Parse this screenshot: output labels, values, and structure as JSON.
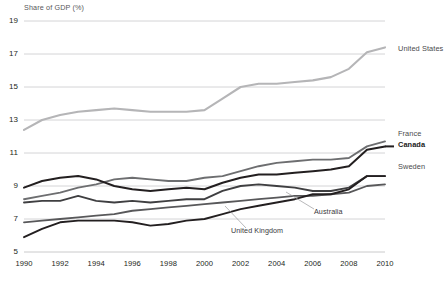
{
  "chart_data": {
    "type": "line",
    "title": "Share of GDP (%)",
    "xlabel": "",
    "ylabel": "Share of GDP (%)",
    "xlim": [
      1990,
      2010
    ],
    "ylim": [
      5,
      19
    ],
    "grid": true,
    "legend_position": "right",
    "y_ticks": [
      "19",
      "17",
      "15",
      "13",
      "11",
      "9",
      "7",
      "5"
    ],
    "y_tick_values": [
      19,
      17,
      15,
      13,
      11,
      9,
      7,
      5
    ],
    "x_ticks": [
      "1990",
      "1992",
      "1994",
      "1996",
      "1998",
      "2000",
      "2002",
      "2004",
      "2006",
      "2008",
      "2010"
    ],
    "x_tick_values": [
      1990,
      1992,
      1994,
      1996,
      1998,
      2000,
      2002,
      2004,
      2006,
      2008,
      2010
    ],
    "x": [
      1990,
      1991,
      1992,
      1993,
      1994,
      1995,
      1996,
      1997,
      1998,
      1999,
      2000,
      2001,
      2002,
      2003,
      2004,
      2005,
      2006,
      2007,
      2008,
      2009,
      2010
    ],
    "series": [
      {
        "name": "United States",
        "label_style": "right-legend",
        "color": "#b5b5b7",
        "width": 2.1,
        "values": [
          12.4,
          13.0,
          13.3,
          13.5,
          13.6,
          13.7,
          13.6,
          13.5,
          13.5,
          13.5,
          13.6,
          14.3,
          15.0,
          15.2,
          15.2,
          15.3,
          15.4,
          15.6,
          16.1,
          17.1,
          17.4
        ]
      },
      {
        "name": "France",
        "label_style": "right-legend",
        "color": "#6d6e70",
        "width": 1.9,
        "values": [
          8.2,
          8.4,
          8.6,
          8.9,
          9.1,
          9.4,
          9.5,
          9.4,
          9.3,
          9.3,
          9.5,
          9.6,
          9.9,
          10.2,
          10.4,
          10.5,
          10.6,
          10.6,
          10.7,
          11.4,
          11.7
        ]
      },
      {
        "name": "Canada",
        "label_style": "right-legend-bold",
        "color": "#231f20",
        "width": 2.0,
        "values": [
          8.9,
          9.3,
          9.5,
          9.6,
          9.4,
          9.0,
          8.8,
          8.7,
          8.8,
          8.9,
          8.8,
          9.2,
          9.5,
          9.7,
          9.7,
          9.8,
          9.9,
          10.0,
          10.2,
          11.2,
          11.4
        ]
      },
      {
        "name": "Sweden",
        "label_style": "right-legend",
        "color": "#3f3f41",
        "width": 1.9,
        "values": [
          8.0,
          8.1,
          8.1,
          8.4,
          8.1,
          8.0,
          8.1,
          8.0,
          8.1,
          8.2,
          8.2,
          8.7,
          9.0,
          9.1,
          9.0,
          8.9,
          8.7,
          8.7,
          8.9,
          9.6,
          9.6
        ]
      },
      {
        "name": "Australia",
        "label_style": "inline-annotation",
        "color": "#58585a",
        "width": 1.8,
        "values": [
          6.8,
          6.9,
          7.0,
          7.1,
          7.2,
          7.3,
          7.5,
          7.6,
          7.7,
          7.8,
          7.9,
          8.0,
          8.1,
          8.2,
          8.3,
          8.4,
          8.4,
          8.5,
          8.6,
          9.0,
          9.1
        ]
      },
      {
        "name": "United Kingdom",
        "label_style": "inline-annotation",
        "color": "#231f20",
        "width": 1.9,
        "values": [
          5.9,
          6.4,
          6.8,
          6.9,
          6.9,
          6.9,
          6.8,
          6.6,
          6.7,
          6.9,
          7.0,
          7.3,
          7.6,
          7.8,
          8.0,
          8.2,
          8.5,
          8.5,
          8.8,
          9.6,
          9.6
        ]
      }
    ],
    "annotations": [
      {
        "text": "Australia",
        "x": 314,
        "y": 212
      },
      {
        "text": "United Kingdom",
        "x": 231,
        "y": 231
      }
    ],
    "legend": [
      {
        "text": "United States",
        "top": 44,
        "bold": false
      },
      {
        "text": "France",
        "top": 129,
        "bold": false
      },
      {
        "text": "Canada",
        "top": 140,
        "bold": true
      },
      {
        "text": "Sweden",
        "top": 162,
        "bold": false
      }
    ]
  }
}
